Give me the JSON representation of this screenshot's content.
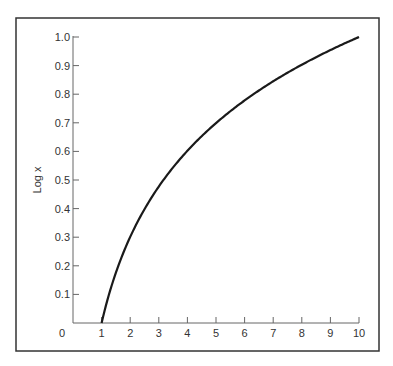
{
  "chart_data": {
    "type": "line",
    "title": "",
    "xlabel": "",
    "ylabel": "Log x",
    "x_ticks": [
      "0",
      "1",
      "2",
      "3",
      "4",
      "5",
      "6",
      "7",
      "8",
      "9",
      "10"
    ],
    "y_ticks": [
      "0.1",
      "0.2",
      "0.3",
      "0.4",
      "0.5",
      "0.6",
      "0.7",
      "0.8",
      "0.9",
      "1.0"
    ],
    "xlim": [
      0,
      10
    ],
    "ylim": [
      0,
      1.0
    ],
    "grid": false,
    "series": [
      {
        "name": "Log x",
        "x": [
          1,
          1.5,
          2,
          2.5,
          3,
          3.5,
          4,
          4.5,
          5,
          5.5,
          6,
          6.5,
          7,
          7.5,
          8,
          8.5,
          9,
          9.5,
          10
        ],
        "values": [
          0,
          0.176,
          0.301,
          0.398,
          0.477,
          0.544,
          0.602,
          0.653,
          0.699,
          0.74,
          0.778,
          0.813,
          0.845,
          0.875,
          0.903,
          0.929,
          0.954,
          0.978,
          1.0
        ]
      }
    ],
    "colors": {
      "line": "#1a1a1a",
      "axis": "#666666",
      "frame": "#333333"
    }
  }
}
